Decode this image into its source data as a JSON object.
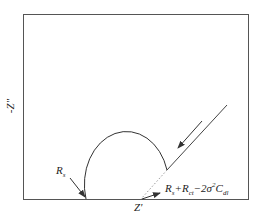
{
  "diagram": {
    "axes": {
      "y_label": "-Z\"",
      "x_label": "Z'"
    },
    "annotations": {
      "rs": {
        "main": "R",
        "sub": "s"
      },
      "intercept": {
        "t1": "R",
        "s1": "s",
        "t2": "+R",
        "s2": "ct",
        "t3": "−2σ",
        "sup3": "2",
        "t4": "C",
        "s4": "dl"
      }
    },
    "elements": [
      "semicircle (charge-transfer region)",
      "Warburg diffusion line at 45°",
      "direction arrow (decreasing frequency)",
      "dotted extrapolation to Z' axis"
    ],
    "colors": {
      "line": "#333333",
      "frame": "#555555",
      "dotted": "#999999"
    }
  }
}
